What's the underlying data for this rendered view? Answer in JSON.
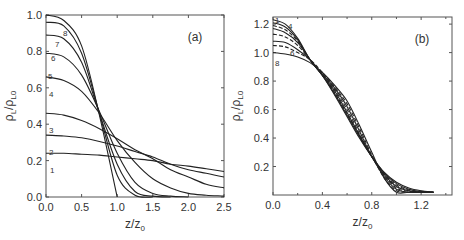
{
  "chart_data": [
    {
      "type": "line",
      "panel_label": "(a)",
      "xlabel": "z/z0",
      "ylabel": "ρL/ρL0",
      "xlim": [
        0,
        2.5
      ],
      "ylim": [
        0,
        1.0
      ],
      "xticks": [
        "0.0",
        "0.5",
        "1.0",
        "1.5",
        "2.0",
        "2.5"
      ],
      "yticks": [
        "0.0",
        "0.2",
        "0.4",
        "0.6",
        "0.8",
        "1.0"
      ],
      "grid": false,
      "x": [
        0,
        0.25,
        0.5,
        0.75,
        1.0,
        1.25,
        1.5,
        1.75,
        2.0,
        2.25,
        2.5
      ],
      "series": [
        {
          "name": "1",
          "values": [
            0.24,
            0.24,
            0.235,
            0.23,
            0.22,
            0.21,
            0.2,
            0.18,
            0.17,
            0.155,
            0.14
          ]
        },
        {
          "name": "2",
          "values": [
            0.34,
            0.335,
            0.325,
            0.305,
            0.28,
            0.25,
            0.22,
            0.18,
            0.15,
            0.13,
            0.11
          ]
        },
        {
          "name": "3",
          "values": [
            0.46,
            0.45,
            0.42,
            0.375,
            0.32,
            0.26,
            0.21,
            0.15,
            0.11,
            0.07,
            0.05
          ]
        },
        {
          "name": "4",
          "values": [
            0.66,
            0.64,
            0.58,
            0.46,
            0.31,
            0.19,
            0.1,
            0.05,
            0.02,
            0.01,
            0.005
          ]
        },
        {
          "name": "5",
          "values": [
            0.79,
            0.77,
            0.67,
            0.47,
            0.24,
            0.08,
            0.02,
            0.005,
            0,
            0,
            0
          ]
        },
        {
          "name": "6",
          "values": [
            0.89,
            0.87,
            0.74,
            0.46,
            0.18,
            0.03,
            0.005,
            0,
            0,
            0,
            0
          ]
        },
        {
          "name": "7",
          "values": [
            0.96,
            0.94,
            0.79,
            0.46,
            0.12,
            0.01,
            0,
            0,
            0,
            0,
            0
          ]
        },
        {
          "name": "8",
          "values": [
            1.0,
            0.97,
            0.83,
            0.45,
            0.0,
            0,
            0,
            0,
            0,
            0,
            0
          ]
        }
      ]
    },
    {
      "type": "line",
      "panel_label": "(b)",
      "xlabel": "z/z0",
      "ylabel": "ρL/ρL0",
      "xlim": [
        0,
        1.45
      ],
      "ylim": [
        0,
        1.25
      ],
      "xticks": [
        "0.0",
        "0.4",
        "0.8",
        "1.2"
      ],
      "yticks": [
        "0.2",
        "0.4",
        "0.6",
        "0.8",
        "1.0",
        "1.2"
      ],
      "grid": false,
      "x": [
        0,
        0.1,
        0.2,
        0.3,
        0.4,
        0.5,
        0.6,
        0.7,
        0.8,
        0.9,
        1.0,
        1.1,
        1.2,
        1.3
      ],
      "series": [
        {
          "name": "1",
          "values": [
            1.23,
            1.2,
            1.1,
            0.95,
            0.84,
            0.7,
            0.55,
            0.4,
            0.27,
            0.16,
            0.09,
            0.05,
            0.03,
            0.02
          ]
        },
        {
          "name": "2",
          "values": [
            1.21,
            1.18,
            1.09,
            0.95,
            0.84,
            0.71,
            0.56,
            0.41,
            0.27,
            0.155,
            0.08,
            0.04,
            0.025,
            0.02
          ]
        },
        {
          "name": "3",
          "values": [
            1.19,
            1.16,
            1.08,
            0.95,
            0.84,
            0.72,
            0.57,
            0.42,
            0.27,
            0.15,
            0.07,
            0.035,
            0.02,
            0.02
          ]
        },
        {
          "name": "4",
          "values": [
            1.17,
            1.14,
            1.07,
            0.95,
            0.84,
            0.73,
            0.58,
            0.42,
            0.27,
            0.145,
            0.06,
            0.03,
            0.02,
            0.02
          ]
        },
        {
          "name": "5",
          "values": [
            1.13,
            1.11,
            1.05,
            0.95,
            0.85,
            0.74,
            0.6,
            0.43,
            0.27,
            0.14,
            0.05,
            0.025,
            0.02,
            0.02
          ]
        },
        {
          "name": "6",
          "values": [
            1.08,
            1.07,
            1.02,
            0.95,
            0.85,
            0.75,
            0.62,
            0.45,
            0.27,
            0.13,
            0.04,
            0.02,
            0.02,
            0.02
          ]
        },
        {
          "name": "7",
          "values": [
            1.05,
            1.04,
            1.0,
            0.95,
            0.86,
            0.76,
            0.64,
            0.47,
            0.28,
            0.12,
            0.03,
            0.02,
            0.02,
            0.02
          ]
        },
        {
          "name": "8",
          "values": [
            1.0,
            0.99,
            0.97,
            0.93,
            0.86,
            0.77,
            0.66,
            0.49,
            0.3,
            0.12,
            0.02,
            0.02,
            0.02,
            0.02
          ]
        }
      ],
      "dashed_series": [
        "3",
        "5",
        "7"
      ]
    }
  ],
  "panels": {
    "a": {
      "label": "(a)",
      "xlabel_main": "z/z",
      "xlabel_sub": "0",
      "ylabel": "ρL/ρL0"
    },
    "b": {
      "label": "(b)",
      "xlabel_main": "z/z",
      "xlabel_sub": "0",
      "ylabel": "ρL/ρL0"
    }
  }
}
